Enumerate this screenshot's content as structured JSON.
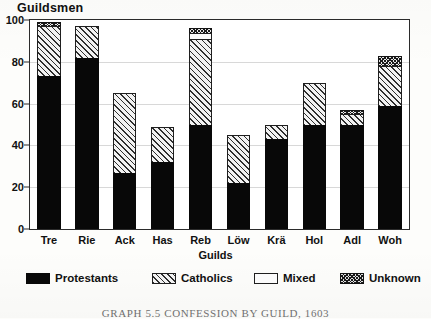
{
  "figure": {
    "title": "Guildsmen",
    "caption": "GRAPH 5.5  CONFESSION BY GUILD, 1603"
  },
  "chart_data": {
    "type": "bar",
    "stacked": true,
    "title": "Guildsmen",
    "xlabel": "Guilds",
    "ylabel": "Guildsmen",
    "ylim": [
      0,
      100
    ],
    "yticks": [
      0,
      20,
      40,
      60,
      80,
      100
    ],
    "ytick_labels": [
      "0",
      "20",
      "40",
      "60",
      "80",
      "100"
    ],
    "grid": true,
    "legend_position": "bottom",
    "categories": [
      "Tre",
      "Rie",
      "Ack",
      "Has",
      "Reb",
      "Löw",
      "Krä",
      "Hol",
      "Adl",
      "Woh"
    ],
    "series": [
      {
        "name": "Protestants",
        "color": "#080808",
        "pattern": "solid",
        "values": [
          73,
          82,
          27,
          32,
          50,
          22,
          43,
          50,
          50,
          59
        ]
      },
      {
        "name": "Catholics",
        "color": "#2e2e2e",
        "pattern": "diagonal-hatch",
        "values": [
          24,
          15,
          38,
          17,
          41,
          23,
          7,
          20,
          5,
          19
        ]
      },
      {
        "name": "Mixed",
        "color": "#fbfbfb",
        "pattern": "blank",
        "values": [
          0,
          0,
          0,
          0,
          3,
          0,
          0,
          0,
          0,
          0
        ]
      },
      {
        "name": "Unknown",
        "color": "#1a1a1a",
        "pattern": "cross-hatch",
        "values": [
          2,
          0,
          0,
          0,
          2,
          0,
          0,
          0,
          2,
          5
        ]
      }
    ],
    "totals": [
      99,
      97,
      65,
      49,
      96,
      45,
      50,
      70,
      57,
      83
    ]
  },
  "legend": {
    "items": [
      {
        "label": "Protestants",
        "key": "protestants"
      },
      {
        "label": "Catholics",
        "key": "catholics"
      },
      {
        "label": "Mixed",
        "key": "mixed"
      },
      {
        "label": "Unknown",
        "key": "unknown"
      }
    ]
  },
  "colors": {
    "axis": "#2b2b2b",
    "grid": "#d8d8d8",
    "text": "#111111",
    "plot_background": "#ffffff",
    "page_background": "#fdfdfb"
  }
}
